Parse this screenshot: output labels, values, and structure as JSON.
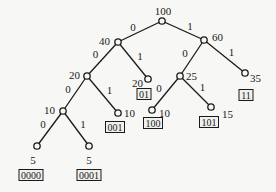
{
  "diagram": {
    "type": "huffman-tree",
    "nodes": [
      {
        "id": "n100",
        "weight": "100"
      },
      {
        "id": "n40",
        "weight": "40"
      },
      {
        "id": "n60",
        "weight": "60"
      },
      {
        "id": "n20i",
        "weight": "20"
      },
      {
        "id": "n20l",
        "weight": "20",
        "code": "01"
      },
      {
        "id": "n25",
        "weight": "25"
      },
      {
        "id": "n35",
        "weight": "35",
        "code": "11"
      },
      {
        "id": "n10i",
        "weight": "10"
      },
      {
        "id": "n10a",
        "weight": "10",
        "code": "001"
      },
      {
        "id": "n10b",
        "weight": "10",
        "code": "100"
      },
      {
        "id": "n15",
        "weight": "15",
        "code": "101"
      },
      {
        "id": "n5a",
        "weight": "5",
        "code": "0000"
      },
      {
        "id": "n5b",
        "weight": "5",
        "code": "0001"
      }
    ],
    "edges": [
      {
        "from": "n100",
        "to": "n40",
        "bit": "0"
      },
      {
        "from": "n100",
        "to": "n60",
        "bit": "1"
      },
      {
        "from": "n40",
        "to": "n20i",
        "bit": "0"
      },
      {
        "from": "n40",
        "to": "n20l",
        "bit": "1"
      },
      {
        "from": "n60",
        "to": "n25",
        "bit": "0"
      },
      {
        "from": "n60",
        "to": "n35",
        "bit": "1"
      },
      {
        "from": "n20i",
        "to": "n10i",
        "bit": "0"
      },
      {
        "from": "n20i",
        "to": "n10a",
        "bit": "1"
      },
      {
        "from": "n25",
        "to": "n10b",
        "bit": "0"
      },
      {
        "from": "n25",
        "to": "n15",
        "bit": "1"
      },
      {
        "from": "n10i",
        "to": "n5a",
        "bit": "0"
      },
      {
        "from": "n10i",
        "to": "n5b",
        "bit": "1"
      }
    ]
  }
}
